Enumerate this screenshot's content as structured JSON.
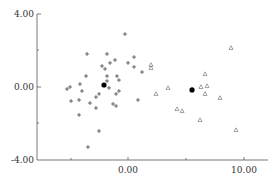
{
  "chart_data": {
    "type": "scatter",
    "title": "",
    "xlabel": "",
    "ylabel": "",
    "xlim": [
      -7.8,
      12.0
    ],
    "ylim": [
      -4.0,
      4.0
    ],
    "grid": false,
    "legend": null,
    "x_ticks": [
      {
        "value": -5,
        "label": ""
      },
      {
        "value": 0,
        "label": "0.00"
      },
      {
        "value": 5,
        "label": ""
      },
      {
        "value": 10,
        "label": "10.00"
      }
    ],
    "y_ticks": [
      {
        "value": 4,
        "label": "4.00"
      },
      {
        "value": 2,
        "label": ""
      },
      {
        "value": 0,
        "label": "0.00"
      },
      {
        "value": -2,
        "label": ""
      },
      {
        "value": -4,
        "label": "-4.00"
      }
    ],
    "series": [
      {
        "name": "cluster-1",
        "marker": "plus",
        "color": "#333333",
        "points": [
          [
            -0.26,
            2.9
          ],
          [
            -3.53,
            1.81
          ],
          [
            -1.81,
            1.81
          ],
          [
            0.52,
            1.64
          ],
          [
            -1.12,
            1.48
          ],
          [
            -1.55,
            1.32
          ],
          [
            -2.24,
            1.15
          ],
          [
            -1.98,
            0.99
          ],
          [
            0.0,
            1.32
          ],
          [
            0.52,
            1.1
          ],
          [
            1.21,
            0.82
          ],
          [
            -3.62,
            0.6
          ],
          [
            -1.81,
            0.6
          ],
          [
            -0.95,
            0.6
          ],
          [
            -0.78,
            0.38
          ],
          [
            -1.81,
            0.33
          ],
          [
            -4.14,
            0.16
          ],
          [
            -5.26,
            -0.11
          ],
          [
            -5.0,
            0.0
          ],
          [
            -1.64,
            -0.05
          ],
          [
            -3.97,
            -0.22
          ],
          [
            -0.78,
            -0.22
          ],
          [
            -1.03,
            -0.38
          ],
          [
            -2.5,
            -0.38
          ],
          [
            -2.76,
            -0.55
          ],
          [
            -4.91,
            -0.77
          ],
          [
            -4.22,
            -0.71
          ],
          [
            -3.28,
            -0.88
          ],
          [
            0.86,
            -0.71
          ],
          [
            -1.29,
            -0.93
          ],
          [
            -1.03,
            -1.04
          ],
          [
            -2.76,
            -1.15
          ],
          [
            -4.22,
            -1.53
          ],
          [
            -2.5,
            -2.41
          ],
          [
            -3.45,
            -3.29
          ]
        ]
      },
      {
        "name": "cluster-2",
        "marker": "triangle",
        "color": "#666666",
        "points": [
          [
            1.98,
            1.21
          ],
          [
            1.98,
            1.04
          ],
          [
            2.41,
            -0.38
          ],
          [
            3.45,
            -0.05
          ],
          [
            4.22,
            -1.21
          ],
          [
            4.66,
            -1.32
          ],
          [
            6.21,
            -1.81
          ],
          [
            6.29,
            0.0
          ],
          [
            6.64,
            0.71
          ],
          [
            6.64,
            -0.38
          ],
          [
            6.81,
            0.05
          ],
          [
            7.93,
            -0.6
          ],
          [
            8.88,
            2.14
          ],
          [
            9.31,
            -2.36
          ]
        ]
      },
      {
        "name": "centroids",
        "marker": "filled-circle",
        "color": "#000000",
        "points": [
          [
            -2.07,
            0.11
          ],
          [
            5.52,
            -0.16
          ]
        ]
      }
    ]
  },
  "axes": {
    "y_labels": {
      "top": "4.00",
      "mid": "0.00",
      "bottom": "-4.00"
    },
    "x_labels": {
      "zero": "0.00",
      "ten": "10.00"
    }
  }
}
